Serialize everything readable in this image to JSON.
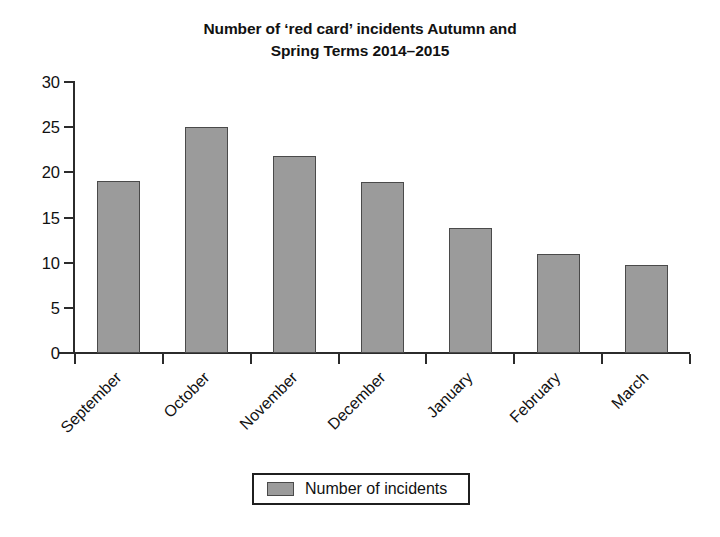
{
  "chart_data": {
    "type": "bar",
    "title_lines": [
      "Number of ‘red card’ incidents Autumn and",
      "Spring Terms 2014–2015"
    ],
    "categories": [
      "September",
      "October",
      "November",
      "December",
      "January",
      "February",
      "March"
    ],
    "values": [
      19,
      25,
      21.8,
      18.9,
      13.8,
      11,
      9.7
    ],
    "series": [
      {
        "name": "Number of incidents",
        "values": [
          19,
          25,
          21.8,
          18.9,
          13.8,
          11,
          9.7
        ]
      }
    ],
    "xlabel": "",
    "ylabel": "",
    "ylim": [
      0,
      30
    ],
    "ytick_values": [
      0,
      5,
      10,
      15,
      20,
      25,
      30
    ],
    "ytick_labels": [
      "0",
      "5",
      "10",
      "15",
      "20",
      "25",
      "30"
    ],
    "grid": false,
    "legend_position": "bottom-center",
    "bar_color": "#9b9b9b",
    "bar_border_color": "#4a4a4a",
    "axis_color": "#2b2b2b",
    "text_color": "#111111",
    "background": "#ffffff"
  },
  "legend": {
    "entries": [
      {
        "label": "Number of incidents",
        "color": "#9b9b9b"
      }
    ]
  }
}
